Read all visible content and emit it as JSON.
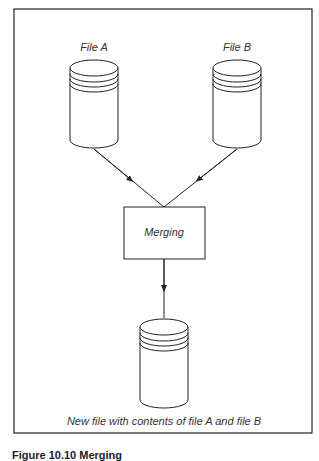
{
  "diagram": {
    "nodes": [
      {
        "id": "file-a",
        "type": "cylinder",
        "label": "File A"
      },
      {
        "id": "file-b",
        "type": "cylinder",
        "label": "File B"
      },
      {
        "id": "merging",
        "type": "process-box",
        "label": "Merging"
      },
      {
        "id": "output",
        "type": "cylinder",
        "label": "New file with contents of file A and file B"
      }
    ],
    "edges": [
      {
        "from": "file-a",
        "to": "merging"
      },
      {
        "from": "file-b",
        "to": "merging"
      },
      {
        "from": "merging",
        "to": "output"
      }
    ]
  },
  "labels": {
    "file_a": "File A",
    "file_b": "File B",
    "merging": "Merging",
    "output": "New file with contents of file A and file B"
  },
  "figure_caption": "Figure 10.10 Merging"
}
